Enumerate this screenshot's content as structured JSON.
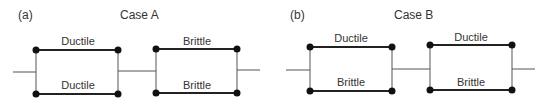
{
  "panels": [
    {
      "tag": "(a)",
      "title": "Case A",
      "blocks": [
        {
          "top": "Ductile",
          "bottom": "Ductile"
        },
        {
          "top": "Brittle",
          "bottom": "Brittle"
        }
      ]
    },
    {
      "tag": "(b)",
      "title": "Case B",
      "blocks": [
        {
          "top": "Ductile",
          "bottom": "Brittle"
        },
        {
          "top": "Ductile",
          "bottom": "Brittle"
        }
      ]
    }
  ],
  "colors": {
    "wire": "#555555",
    "element": "#222222",
    "node": "#111111",
    "text": "#333333"
  }
}
